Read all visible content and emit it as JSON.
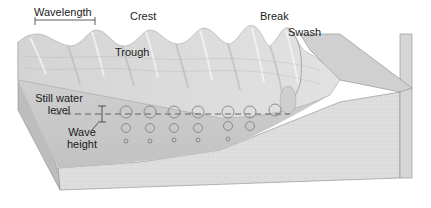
{
  "figure": {
    "type": "block-diagram"
  },
  "labels": {
    "wavelength": "Wavelength",
    "crest": "Crest",
    "trough": "Trough",
    "break": "Break",
    "swash": "Swash",
    "still_water_level_line1": "Still water",
    "still_water_level_line2": "level",
    "wave_height_line1": "Wave",
    "wave_height_line2": "height"
  },
  "colors": {
    "background": "#ffffff",
    "water_surface": "#d9d9d9",
    "water_highlight": "#ececec",
    "water_shadow": "#bdbdbd",
    "front_face_water": "#c8c8c8",
    "sea_floor": "#dcdcdc",
    "outline": "#8a8a8a",
    "text": "#1a1a1a",
    "orbit_stroke": "#7a7a7a",
    "dash_line": "#6a6a6a"
  },
  "orbits": {
    "columns": 7,
    "rows_per_column": [
      3,
      3,
      3,
      3,
      3,
      2,
      1
    ]
  }
}
